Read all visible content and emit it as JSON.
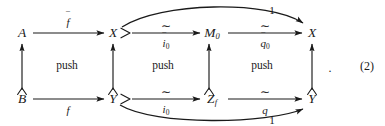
{
  "diagram": {
    "kind": "commutative-diagram",
    "equation_number": "(2)",
    "trailing_punctuation": ".",
    "stroke_color": "#1a1a1a",
    "background_color": "#ffffff",
    "nodes": [
      {
        "id": "A",
        "label": "A",
        "sub": "",
        "x": 22,
        "y": 33
      },
      {
        "id": "X1",
        "label": "X",
        "sub": "",
        "x": 113,
        "y": 33
      },
      {
        "id": "M0",
        "label": "M",
        "sub": "0",
        "x": 212,
        "y": 33
      },
      {
        "id": "X2",
        "label": "X",
        "sub": "",
        "x": 312,
        "y": 33
      },
      {
        "id": "B",
        "label": "B",
        "sub": "",
        "x": 22,
        "y": 99
      },
      {
        "id": "Y1",
        "label": "Y",
        "sub": "",
        "x": 113,
        "y": 99
      },
      {
        "id": "Zf",
        "label": "Z",
        "sub": "f",
        "x": 212,
        "y": 99
      },
      {
        "id": "Y2",
        "label": "Y",
        "sub": "",
        "x": 312,
        "y": 99
      }
    ],
    "horizontal_arrows": [
      {
        "id": "A-to-X1",
        "from": "A",
        "to": "X1",
        "label_base": "f",
        "label_accent": "bar",
        "label_sub": "",
        "label_position": "above",
        "has_tilde_over": false,
        "has_tail_hook": false
      },
      {
        "id": "X1-to-M0",
        "from": "X1",
        "to": "M0",
        "label_base": "i",
        "label_accent": "bar",
        "label_sub": "0",
        "label_position": "below",
        "has_tilde_over": true,
        "has_tail_hook": true
      },
      {
        "id": "M0-to-X2",
        "from": "M0",
        "to": "X2",
        "label_base": "q",
        "label_accent": "bar",
        "label_sub": "0",
        "label_position": "below",
        "has_tilde_over": true,
        "has_tail_hook": false
      },
      {
        "id": "B-to-Y1",
        "from": "B",
        "to": "Y1",
        "label_base": "f",
        "label_accent": "none",
        "label_sub": "",
        "label_position": "below",
        "has_tilde_over": false,
        "has_tail_hook": false
      },
      {
        "id": "Y1-to-Zf",
        "from": "Y1",
        "to": "Zf",
        "label_base": "i",
        "label_accent": "none",
        "label_sub": "0",
        "label_position": "below",
        "has_tilde_over": true,
        "has_tail_hook": true
      },
      {
        "id": "Zf-to-Y2",
        "from": "Zf",
        "to": "Y2",
        "label_base": "q",
        "label_accent": "none",
        "label_sub": "",
        "label_position": "below",
        "has_tilde_over": true,
        "has_tail_hook": false
      }
    ],
    "vertical_arrows": [
      {
        "id": "B-to-A",
        "from": "B",
        "to": "A",
        "direction": "up",
        "has_tail_hook": true
      },
      {
        "id": "Y1-to-X1",
        "from": "Y1",
        "to": "X1",
        "direction": "up",
        "has_tail_hook": true
      },
      {
        "id": "Zf-to-M0",
        "from": "Zf",
        "to": "M0",
        "direction": "up",
        "has_tail_hook": true
      },
      {
        "id": "Y2-to-X2",
        "from": "Y2",
        "to": "X2",
        "direction": "up",
        "has_tail_hook": true
      }
    ],
    "curved_arrows": [
      {
        "id": "identity-top",
        "label": "1",
        "from": "X1",
        "to": "X2",
        "side": "above"
      },
      {
        "id": "identity-bottom",
        "label": "1",
        "from": "Y1",
        "to": "Y2",
        "side": "below"
      }
    ],
    "region_labels": [
      {
        "id": "push-left",
        "text": "push",
        "x": 67,
        "y": 66
      },
      {
        "id": "push-middle",
        "text": "push",
        "x": 163,
        "y": 66
      },
      {
        "id": "push-right",
        "text": "push",
        "x": 262,
        "y": 66
      }
    ],
    "accents": {
      "bar": "‾",
      "tilde": "~"
    },
    "tilde_glyph": "∼"
  }
}
